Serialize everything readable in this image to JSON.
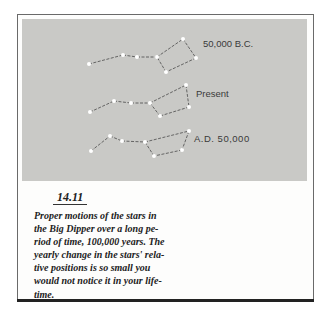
{
  "figure": {
    "number": "14.11",
    "caption_lines": [
      "Proper motions of the stars in",
      "the Big Dipper over a long pe-",
      "riod of time, 100,000 years. The",
      "yearly change in the stars' rela-",
      "tive positions is so small you",
      "would not notice it in your life-",
      "time."
    ],
    "colors": {
      "panel": "#c9c9c6",
      "star": "#ffffff",
      "line": "#4a4a4a",
      "text": "#222222"
    }
  },
  "constellations": [
    {
      "label": "50,000 B.C.",
      "stars": [
        [
          89,
          64
        ],
        [
          123,
          55
        ],
        [
          137,
          57
        ],
        [
          157,
          57
        ],
        [
          183,
          39
        ],
        [
          196,
          58
        ],
        [
          166,
          72
        ]
      ],
      "lines": [
        [
          0,
          1
        ],
        [
          1,
          2
        ],
        [
          2,
          3
        ],
        [
          3,
          4
        ],
        [
          4,
          5
        ],
        [
          5,
          6
        ],
        [
          6,
          3
        ]
      ]
    },
    {
      "label": "Present",
      "stars": [
        [
          90,
          112
        ],
        [
          114,
          101
        ],
        [
          131,
          103
        ],
        [
          150,
          103
        ],
        [
          186,
          85
        ],
        [
          189,
          107
        ],
        [
          160,
          116
        ]
      ],
      "lines": [
        [
          0,
          1
        ],
        [
          1,
          2
        ],
        [
          2,
          3
        ],
        [
          3,
          4
        ],
        [
          4,
          5
        ],
        [
          5,
          6
        ],
        [
          6,
          3
        ]
      ]
    },
    {
      "label": "A.D. 50,000",
      "stars": [
        [
          91,
          151
        ],
        [
          110,
          136
        ],
        [
          122,
          141
        ],
        [
          145,
          142
        ],
        [
          189,
          131
        ],
        [
          182,
          150
        ],
        [
          154,
          156
        ]
      ],
      "lines": [
        [
          0,
          1
        ],
        [
          1,
          2
        ],
        [
          2,
          3
        ],
        [
          3,
          4
        ],
        [
          4,
          5
        ],
        [
          5,
          6
        ],
        [
          6,
          3
        ]
      ]
    }
  ]
}
